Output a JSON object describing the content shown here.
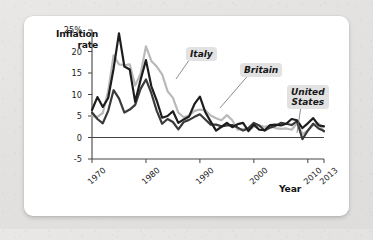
{
  "figure": {
    "background_color": "#ffffff",
    "page_background_color": "#e6e5e3"
  },
  "chart_data": {
    "type": "line",
    "title": "",
    "xlabel": "Year",
    "ylabel": "Inflation rate",
    "ylabel_line1": "Inflation",
    "ylabel_line2": "rate",
    "xlim": [
      1970,
      2013
    ],
    "ylim": [
      -5,
      25
    ],
    "grid": false,
    "zero_line": true,
    "legend_position": "inline-callouts",
    "y_ticks": [
      "25%",
      "20",
      "15",
      "10",
      "5",
      "0",
      "-5"
    ],
    "y_tick_values": [
      25,
      20,
      15,
      10,
      5,
      0,
      -5
    ],
    "x_ticks": [
      "1970",
      "1980",
      "1990",
      "2000",
      "2010",
      "2013"
    ],
    "x_tick_values": [
      1970,
      1980,
      1990,
      2000,
      2010,
      2013
    ],
    "x": [
      1970,
      1971,
      1972,
      1973,
      1974,
      1975,
      1976,
      1977,
      1978,
      1979,
      1980,
      1981,
      1982,
      1983,
      1984,
      1985,
      1986,
      1987,
      1988,
      1989,
      1990,
      1991,
      1992,
      1993,
      1994,
      1995,
      1996,
      1997,
      1998,
      1999,
      2000,
      2001,
      2002,
      2003,
      2004,
      2005,
      2006,
      2007,
      2008,
      2009,
      2010,
      2011,
      2012,
      2013
    ],
    "series": [
      {
        "name": "Britain",
        "color": "#1d1d1d",
        "width": 2.2,
        "values": [
          6.4,
          9.4,
          7.1,
          9.2,
          16.0,
          24.2,
          16.5,
          15.8,
          8.3,
          13.4,
          18.0,
          11.9,
          8.6,
          4.6,
          5.0,
          6.1,
          3.4,
          4.2,
          4.9,
          7.8,
          9.5,
          5.9,
          3.7,
          1.6,
          2.5,
          3.4,
          2.4,
          3.1,
          3.4,
          1.5,
          3.0,
          1.8,
          1.7,
          2.9,
          3.0,
          2.8,
          3.2,
          4.3,
          4.0,
          2.2,
          3.3,
          4.5,
          2.8,
          2.6
        ]
      },
      {
        "name": "Italy",
        "color": "#b9b9b9",
        "width": 2.2,
        "values": [
          5.0,
          4.8,
          5.7,
          10.8,
          19.1,
          17.0,
          16.8,
          17.0,
          12.1,
          14.8,
          21.2,
          17.8,
          16.5,
          14.7,
          10.8,
          9.2,
          5.8,
          4.7,
          5.1,
          6.2,
          6.5,
          6.3,
          5.1,
          4.5,
          4.0,
          5.2,
          4.0,
          1.8,
          2.0,
          1.7,
          2.5,
          2.8,
          2.5,
          2.7,
          2.2,
          2.0,
          2.1,
          1.8,
          3.3,
          0.8,
          1.6,
          2.9,
          3.3,
          1.3
        ]
      },
      {
        "name": "United States",
        "color": "#3a3a3a",
        "width": 2.2,
        "values": [
          5.8,
          4.3,
          3.3,
          6.2,
          11.0,
          9.1,
          5.8,
          6.5,
          7.6,
          11.3,
          13.5,
          10.3,
          6.2,
          3.2,
          4.3,
          3.6,
          1.9,
          3.6,
          4.1,
          4.8,
          5.4,
          4.2,
          3.0,
          3.0,
          2.6,
          2.8,
          2.9,
          2.3,
          1.6,
          2.2,
          3.4,
          2.8,
          1.6,
          2.3,
          2.7,
          3.4,
          3.2,
          2.9,
          3.8,
          -0.4,
          1.6,
          3.2,
          2.1,
          1.5
        ]
      }
    ],
    "annotations": [
      {
        "label": "Italy",
        "series": "Italy"
      },
      {
        "label": "Britain",
        "series": "Britain"
      },
      {
        "label": "United\nStates",
        "series": "United States"
      }
    ]
  }
}
